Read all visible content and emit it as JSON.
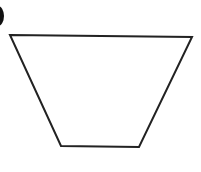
{
  "figure": {
    "shape": "trapezoid",
    "stroke_color": "#222222",
    "background": "#ffffff",
    "vertices": {
      "top_left": [
        10,
        35
      ],
      "top_right": [
        192,
        37
      ],
      "bottom_right": [
        139,
        147
      ],
      "bottom_left": [
        61,
        146
      ]
    },
    "marker": {
      "type": "partial-filled-circle",
      "color": "#111111"
    }
  }
}
